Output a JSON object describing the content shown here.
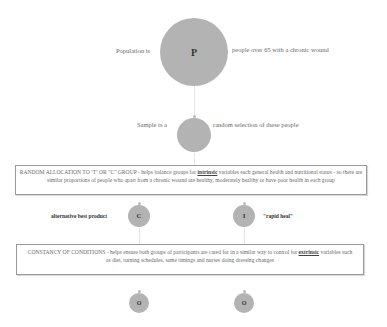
{
  "population": {
    "prefix": "Population is",
    "node_label": "P",
    "description": "people over 65 with a chronic wound"
  },
  "sample": {
    "prefix": "Sample is a",
    "node_label": "",
    "description": "random selection of these people"
  },
  "random_allocation_box": {
    "heading": "RANDOM ALLOCATION TO \"I\" OR \"C\" GROUP",
    "text_before": " - helps balance groups for ",
    "keyword": "intrinsic",
    "text_after": " variables such general health and nutritional status - so there are similar proportions of people who apart from a chronic wound are healthy, moderately healthy or have poor health in each group"
  },
  "comparison": {
    "label": "alternative best product",
    "node_label": "C"
  },
  "intervention": {
    "label": "\"rapid heal\"",
    "node_label": "I"
  },
  "constancy_box": {
    "heading": "CONSTANCY OF CONDITIONS",
    "text_before": " - helps ensure both groups of participants are cared for in a similar way to control for ",
    "keyword": "extrinsic",
    "text_after": " variables such as diet, turning schedules, same timings and nurses doing dressing changes"
  },
  "outcomes": [
    {
      "node_label": "O"
    },
    {
      "node_label": "O"
    }
  ],
  "colors": {
    "node_fill": "#b3b3b3",
    "box_border": "#9a9a9a",
    "text": "#6a6a6a"
  }
}
